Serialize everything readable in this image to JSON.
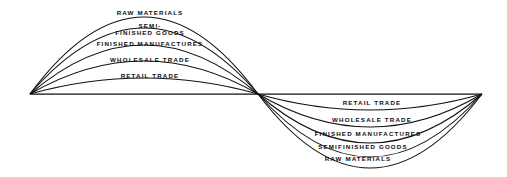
{
  "figure": {
    "background_color": "#ffffff",
    "line_color": "#111111",
    "title": "",
    "left_lobe": {
      "name": "upper-left-lobe",
      "labels": [
        "RAW MATERIALS",
        "SEMI-\nFINISHED GOODS",
        "FINISHED MANUFACTURES",
        "WHOLESALE TRADE",
        "RETAIL TRADE"
      ]
    },
    "right_lobe": {
      "name": "lower-right-lobe",
      "labels": [
        "RETAIL TRADE",
        "WHOLESALE TRADE",
        "FINISHED MANUFACTURES",
        "SEMIFINISHED GOODS",
        "RAW MATERIALS"
      ]
    }
  },
  "chart_data": {
    "type": "diagram",
    "title": "",
    "xlabel": "",
    "ylabel": "",
    "geometry": {
      "width": 507,
      "height": 177,
      "left_vertex": [
        30,
        94
      ],
      "center_vertex": [
        258,
        94
      ],
      "right_vertex": [
        482,
        94
      ],
      "baseline_y": 94
    },
    "series": [
      {
        "name": "upper-left-lobe",
        "direction": "up",
        "x_start": 30,
        "x_end": 258,
        "arcs": [
          {
            "label": "RAW MATERIALS",
            "apex_y": 17,
            "label_y": 9,
            "label_x": 150,
            "lines": 1
          },
          {
            "label": "SEMI-\nFINISHED GOODS",
            "apex_y": 28,
            "label_y": 22,
            "label_x": 150,
            "lines": 2
          },
          {
            "label": "FINISHED MANUFACTURES",
            "apex_y": 45,
            "label_y": 40,
            "label_x": 150,
            "lines": 1
          },
          {
            "label": "WHOLESALE TRADE",
            "apex_y": 61,
            "label_y": 56,
            "label_x": 150,
            "lines": 1
          },
          {
            "label": "RETAIL TRADE",
            "apex_y": 78,
            "label_y": 72,
            "label_x": 150,
            "lines": 1
          }
        ]
      },
      {
        "name": "lower-right-lobe",
        "direction": "down",
        "x_start": 258,
        "x_end": 482,
        "arcs": [
          {
            "label": "RETAIL TRADE",
            "apex_y": 110,
            "label_y": 99,
            "label_x": 372,
            "lines": 1
          },
          {
            "label": "WHOLESALE TRADE",
            "apex_y": 127,
            "label_y": 116,
            "label_x": 372,
            "lines": 1
          },
          {
            "label": "FINISHED MANUFACTURES",
            "apex_y": 143,
            "label_y": 130,
            "label_x": 368,
            "lines": 1
          },
          {
            "label": "SEMIFINISHED GOODS",
            "apex_y": 157,
            "label_y": 143,
            "label_x": 363,
            "lines": 1
          },
          {
            "label": "RAW MATERIALS",
            "apex_y": 168,
            "label_y": 155,
            "label_x": 358,
            "lines": 1
          }
        ]
      }
    ]
  }
}
